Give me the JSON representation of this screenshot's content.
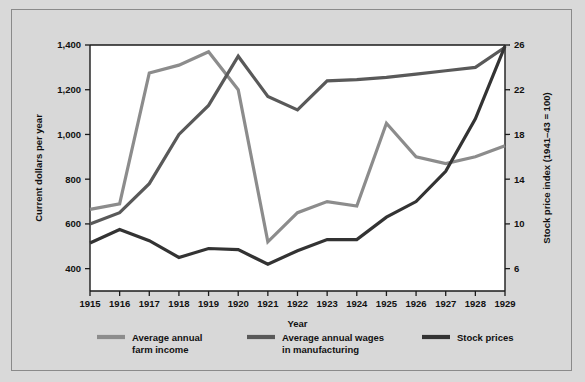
{
  "figure": {
    "background_color": "#d8d8d8",
    "plot_background_color": "#ffffff",
    "border_color": "#8a8a8a"
  },
  "chart_data": {
    "type": "line",
    "title": "",
    "xlabel": "Year",
    "ylabel": "Current dollars per year",
    "y2label": "Stock price index (1941–43 = 100)",
    "x": [
      1915,
      1916,
      1917,
      1918,
      1919,
      1920,
      1921,
      1922,
      1923,
      1924,
      1925,
      1926,
      1927,
      1928,
      1929
    ],
    "xlim": [
      1915,
      1929
    ],
    "ylim": [
      300,
      1400
    ],
    "y2lim": [
      4,
      26
    ],
    "yticks": [
      400,
      600,
      800,
      1000,
      1200,
      1400
    ],
    "ytick_labels": [
      "400",
      "600",
      "800",
      "1,000",
      "1,200",
      "1,400"
    ],
    "y2ticks": [
      6,
      10,
      14,
      18,
      22,
      26
    ],
    "y2tick_labels": [
      "6",
      "10",
      "14",
      "18",
      "22",
      "26"
    ],
    "xtick_labels": [
      "1915",
      "1916",
      "1917",
      "1918",
      "1919",
      "1920",
      "1921",
      "1922",
      "1923",
      "1924",
      "1925",
      "1926",
      "1927",
      "1928",
      "1929"
    ],
    "grid": false,
    "legend_position": "bottom",
    "series": [
      {
        "name": "Average annual farm income",
        "legend_label_line1": "Average annual",
        "legend_label_line2": "farm income",
        "color": "#8c8c8c",
        "axis": "left",
        "values": [
          665,
          690,
          1275,
          1310,
          1370,
          1200,
          520,
          650,
          700,
          680,
          1050,
          900,
          870,
          900,
          950
        ]
      },
      {
        "name": "Average annual wages in manufacturing",
        "legend_label_line1": "Average annual wages",
        "legend_label_line2": "in manufacturing",
        "color": "#595959",
        "axis": "left",
        "values": [
          600,
          650,
          780,
          1000,
          1130,
          1350,
          1170,
          1110,
          1240,
          1245,
          1255,
          1270,
          1285,
          1300,
          1390
        ]
      },
      {
        "name": "Stock prices",
        "legend_label_line1": "Stock prices",
        "legend_label_line2": "",
        "color": "#333333",
        "axis": "right",
        "values": [
          8.3,
          9.5,
          8.5,
          7.0,
          7.8,
          7.7,
          6.4,
          7.6,
          8.6,
          8.6,
          10.6,
          12.0,
          14.7,
          19.4,
          25.9
        ]
      }
    ]
  }
}
